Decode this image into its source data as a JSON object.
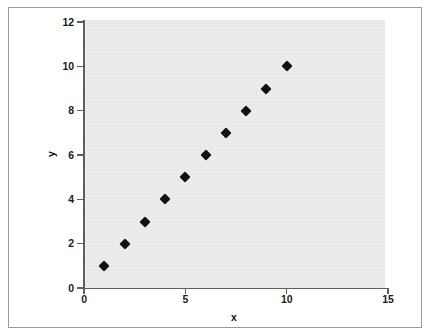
{
  "chart_data": {
    "type": "scatter",
    "title": "",
    "xlabel": "x",
    "ylabel": "y",
    "x": [
      1,
      2,
      3,
      4,
      5,
      6,
      7,
      8,
      9,
      10
    ],
    "y": [
      1,
      2,
      3,
      4,
      5,
      6,
      7,
      8,
      9,
      10
    ],
    "points": [
      {
        "x": 1,
        "y": 1
      },
      {
        "x": 2,
        "y": 2
      },
      {
        "x": 3,
        "y": 3
      },
      {
        "x": 4,
        "y": 4
      },
      {
        "x": 5,
        "y": 5
      },
      {
        "x": 6,
        "y": 6
      },
      {
        "x": 7,
        "y": 7
      },
      {
        "x": 8,
        "y": 8
      },
      {
        "x": 9,
        "y": 9
      },
      {
        "x": 10,
        "y": 10
      }
    ],
    "xlim": [
      0,
      15
    ],
    "ylim": [
      0,
      12
    ],
    "xticks": [
      0,
      5,
      10,
      15
    ],
    "yticks": [
      0,
      2,
      4,
      6,
      8,
      10,
      12
    ],
    "xtick_labels": [
      "0",
      "5",
      "10",
      "15"
    ],
    "ytick_labels": [
      "0",
      "2",
      "4",
      "6",
      "8",
      "10",
      "12"
    ],
    "grid": false,
    "legend": null,
    "marker": "diamond",
    "marker_color": "#111111",
    "plot_background": "#ececec",
    "axis_color": "#5f5f5f",
    "frame_color": "#9a9a9a"
  }
}
